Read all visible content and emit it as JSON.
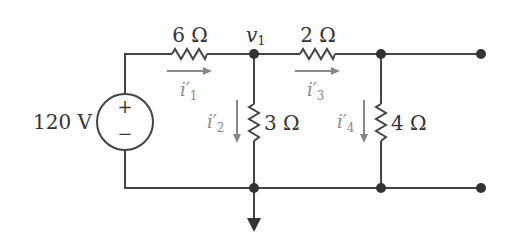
{
  "circuit": {
    "source": {
      "label": "120 V",
      "plus": "+",
      "minus": "−"
    },
    "resistors": [
      {
        "id": "R1",
        "label": "6 Ω"
      },
      {
        "id": "R2",
        "label": "3 Ω"
      },
      {
        "id": "R3",
        "label": "2 Ω"
      },
      {
        "id": "R4",
        "label": "4 Ω"
      }
    ],
    "node_label": {
      "main": "v",
      "sub": "1"
    },
    "currents": [
      {
        "main": "i′",
        "sub": "1"
      },
      {
        "main": "i′",
        "sub": "2"
      },
      {
        "main": "i′",
        "sub": "3"
      },
      {
        "main": "i′",
        "sub": "4"
      }
    ],
    "colors": {
      "wire": "#444444",
      "current_arrow": "#888888",
      "text": "#333333"
    }
  }
}
